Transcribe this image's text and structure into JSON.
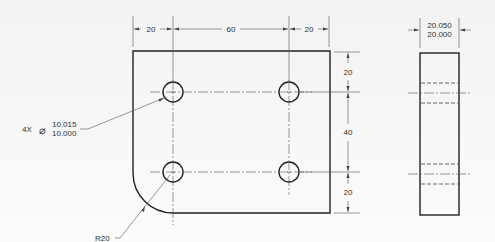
{
  "drawing": {
    "front_view": {
      "top_dims": [
        "20",
        "60",
        "20"
      ],
      "right_dims": [
        "20",
        "40",
        "20"
      ],
      "hole_callout": {
        "count": "4X",
        "symbol": "⌀",
        "upper_limit": "10.015",
        "lower_limit": "10.000"
      },
      "radius_callout": "R20"
    },
    "side_view": {
      "thickness_upper": "20.050",
      "thickness_lower": "20.000"
    }
  }
}
